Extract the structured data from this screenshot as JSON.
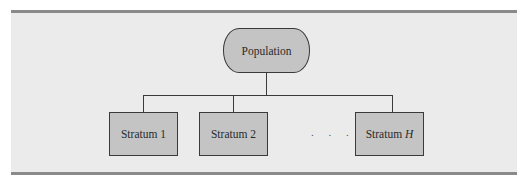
{
  "diagram": {
    "type": "hierarchy",
    "root": {
      "label": "Population",
      "shape": "terminator"
    },
    "children": [
      {
        "label": "Stratum 1",
        "shape": "rectangle"
      },
      {
        "label": "Stratum 2",
        "shape": "rectangle"
      },
      {
        "label": "Stratum ",
        "label_var": "H",
        "shape": "rectangle"
      }
    ],
    "ellipsis": ". . .",
    "colors": {
      "node_fill": "#c4c4c4",
      "node_border": "#3a3a3a",
      "panel_bg": "#ebebeb",
      "rule": "#8a8a8a"
    }
  }
}
